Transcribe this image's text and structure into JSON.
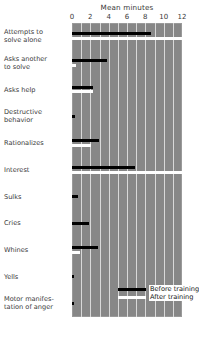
{
  "chart_data": {
    "type": "bar",
    "orientation": "horizontal",
    "title": "Mean minutes",
    "xlabel": "Mean minutes",
    "ylabel": "",
    "xlim": [
      0,
      12
    ],
    "xticks": [
      0,
      2,
      4,
      6,
      8,
      10,
      12
    ],
    "xtick_labels": [
      "0",
      "2",
      "4",
      "6",
      "8",
      "10",
      "12"
    ],
    "grid": true,
    "grid_interval": 1,
    "legend_position": "bottom-right",
    "categories": [
      "Attempts to solve alone",
      "Asks another to solve",
      "Asks help",
      "Destructive behavior",
      "Rationalizes",
      "Interest",
      "Sulks",
      "Cries",
      "Whines",
      "Yells",
      "Motor manifestation of anger"
    ],
    "series": [
      {
        "name": "Before training",
        "color": "#000000",
        "values": [
          8.6,
          3.8,
          2.3,
          0.3,
          2.9,
          6.9,
          0.7,
          1.8,
          2.8,
          0.2,
          0.2
        ]
      },
      {
        "name": "After training",
        "color": "#ffffff",
        "values": [
          12.0,
          0.4,
          2.3,
          0.0,
          2.1,
          12.0,
          0.0,
          0.0,
          0.9,
          0.0,
          0.0
        ]
      }
    ]
  },
  "axis": {
    "title": "Mean minutes",
    "tick_labels": [
      "0",
      "2",
      "4",
      "6",
      "8",
      "10",
      "12"
    ]
  },
  "categories": [
    {
      "line1": "Attempts to",
      "line2": "solve alone"
    },
    {
      "line1": "Asks another",
      "line2": "to solve"
    },
    {
      "line1": "Asks help",
      "line2": ""
    },
    {
      "line1": "Destructive",
      "line2": "behavior"
    },
    {
      "line1": "Rationalizes",
      "line2": ""
    },
    {
      "line1": "Interest",
      "line2": ""
    },
    {
      "line1": "Sulks",
      "line2": ""
    },
    {
      "line1": "Cries",
      "line2": ""
    },
    {
      "line1": "Whines",
      "line2": ""
    },
    {
      "line1": "Yells",
      "line2": ""
    },
    {
      "line1": "Motor manifes-",
      "line2": "tation of anger"
    }
  ],
  "legend": {
    "before_label": "Before training",
    "after_label": "After training"
  },
  "colors": {
    "plot_background": "#878787",
    "gridline": "#d8d8d8",
    "before": "#000000",
    "after": "#ffffff",
    "text": "#3a3a3a"
  }
}
